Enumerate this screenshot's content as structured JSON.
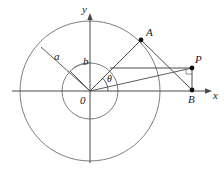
{
  "figure": {
    "type": "geometry-diagram",
    "width": 224,
    "height": 171,
    "background_color": "#ffffff",
    "stroke_color": "#555555",
    "line_color": "#4a4a4a",
    "text_color": "#1a1a1a"
  },
  "axes": {
    "x_label": "x",
    "y_label": "y",
    "origin_label": "0",
    "origin": {
      "x": 90,
      "y": 91
    },
    "x_axis": {
      "x1": 12,
      "y1": 91,
      "x2": 212,
      "y2": 91
    },
    "y_axis": {
      "x1": 90,
      "y1": 162,
      "x2": 90,
      "y2": 14
    }
  },
  "circles": [
    {
      "name": "outer-circle",
      "radius_label": "a",
      "cx": 90,
      "cy": 91,
      "r": 70
    },
    {
      "name": "inner-circle",
      "radius_label": "b",
      "cx": 90,
      "cy": 91,
      "r": 28
    }
  ],
  "points": [
    {
      "name": "A",
      "label": "A",
      "x": 141,
      "y": 40,
      "label_x": 147,
      "label_y": 28
    },
    {
      "name": "P",
      "label": "P",
      "x": 192,
      "y": 68,
      "label_x": 196,
      "label_y": 55
    },
    {
      "name": "B",
      "label": "B",
      "x": 192,
      "y": 90,
      "label_x": 190,
      "label_y": 96
    }
  ],
  "labels": {
    "radius_a": "a",
    "radius_b": "b",
    "angle_theta": "θ",
    "radius_a_x": 55,
    "radius_a_y": 50,
    "radius_b_x": 83,
    "radius_b_y": 58,
    "theta_x": 108,
    "theta_y": 73
  },
  "segments": [
    {
      "name": "radius-a-leader",
      "x1": 90,
      "y1": 91,
      "x2": 41,
      "y2": 47
    },
    {
      "name": "radius-b-leader",
      "x1": 90,
      "y1": 91,
      "x2": 71,
      "y2": 70
    },
    {
      "name": "OA-ray",
      "x1": 90,
      "y1": 91,
      "x2": 141,
      "y2": 40
    },
    {
      "name": "AB-segment",
      "x1": 141,
      "y1": 40,
      "x2": 192,
      "y2": 90
    },
    {
      "name": "horizontal-to-P",
      "x1": 112,
      "y1": 68,
      "x2": 192,
      "y2": 68
    },
    {
      "name": "PB-segment",
      "x1": 192,
      "y1": 68,
      "x2": 192,
      "y2": 90
    },
    {
      "name": "O-to-B-ray",
      "x1": 90,
      "y1": 91,
      "x2": 192,
      "y2": 68
    }
  ],
  "angle_arc": {
    "name": "theta-arc",
    "cx": 90,
    "cy": 91,
    "r": 18,
    "start_deg": 0,
    "end_deg": 45
  }
}
